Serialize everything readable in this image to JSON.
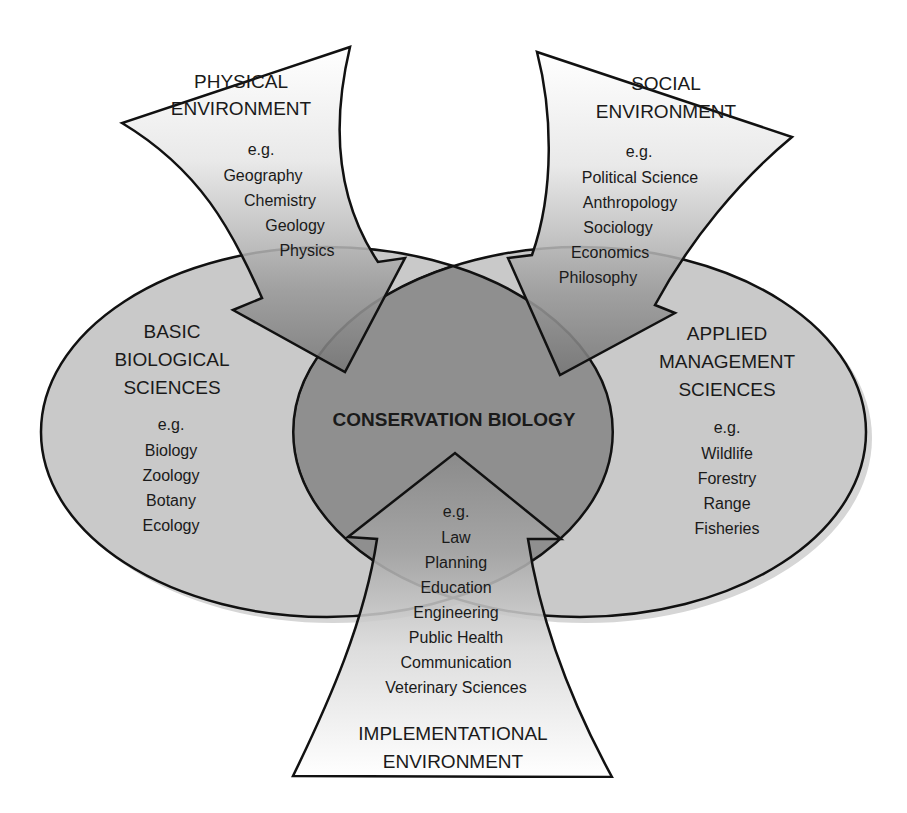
{
  "diagram": {
    "title": "CONSERVATION BIOLOGY",
    "physical": {
      "heading": [
        "PHYSICAL",
        "ENVIRONMENT"
      ],
      "eg": "e.g.",
      "items": [
        "Geography",
        "Chemistry",
        "Geology",
        "Physics"
      ]
    },
    "social": {
      "heading": [
        "SOCIAL",
        "ENVIRONMENT"
      ],
      "eg": "e.g.",
      "items": [
        "Political Science",
        "Anthropology",
        "Sociology",
        "Economics",
        "Philosophy"
      ]
    },
    "basic": {
      "heading": [
        "BASIC",
        "BIOLOGICAL",
        "SCIENCES"
      ],
      "eg": "e.g.",
      "items": [
        "Biology",
        "Zoology",
        "Botany",
        "Ecology"
      ]
    },
    "applied": {
      "heading": [
        "APPLIED",
        "MANAGEMENT",
        "SCIENCES"
      ],
      "eg": "e.g.",
      "items": [
        "Wildlife",
        "Forestry",
        "Range",
        "Fisheries"
      ]
    },
    "implementational": {
      "heading": [
        "IMPLEMENTATIONAL",
        "ENVIRONMENT"
      ],
      "eg": "e.g.",
      "items": [
        "Law",
        "Planning",
        "Education",
        "Engineering",
        "Public Health",
        "Communication",
        "Veterinary Sciences"
      ]
    },
    "colors": {
      "ellipse_fill": "#c9c9c9",
      "lens_fill": "#8f8f8f",
      "arrow_dark": "#7a7a7a",
      "stroke": "#111111"
    }
  }
}
